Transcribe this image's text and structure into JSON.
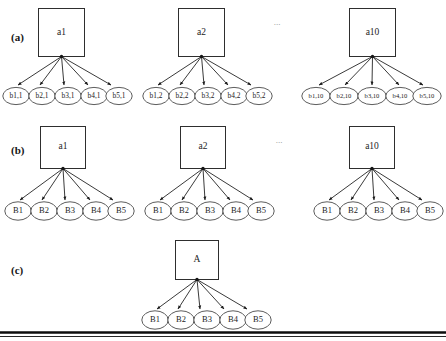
{
  "figure": {
    "caption_rows": [
      {
        "id": "row-a",
        "label": "(a)"
      },
      {
        "id": "row-b",
        "label": "(b)"
      },
      {
        "id": "row-c",
        "label": "(c)"
      }
    ],
    "ellipsis": "...",
    "rows": [
      {
        "id": "row-a",
        "label": "(a)",
        "groups": [
          {
            "id": "group-a1",
            "root": "a1",
            "leaves": [
              "b1,1",
              "b2,1",
              "b3,1",
              "b4,1",
              "b5,1"
            ]
          },
          {
            "id": "group-a2",
            "root": "a2",
            "leaves": [
              "b1,2",
              "b2,2",
              "b3,2",
              "b4,2",
              "b5,2"
            ]
          },
          {
            "id": "group-a10",
            "root": "a10",
            "leaves": [
              "b1,10",
              "b2,10",
              "b3,10",
              "b4,10",
              "b5,10"
            ]
          }
        ]
      },
      {
        "id": "row-b",
        "label": "(b)",
        "groups": [
          {
            "id": "group-b1",
            "root": "a1",
            "leaves": [
              "B1",
              "B2",
              "B3",
              "B4",
              "B5"
            ]
          },
          {
            "id": "group-b2",
            "root": "a2",
            "leaves": [
              "B1",
              "B2",
              "B3",
              "B4",
              "B5"
            ]
          },
          {
            "id": "group-b10",
            "root": "a10",
            "leaves": [
              "B1",
              "B2",
              "B3",
              "B4",
              "B5"
            ]
          }
        ]
      },
      {
        "id": "row-c",
        "label": "(c)",
        "groups": [
          {
            "id": "group-c1",
            "root": "A",
            "leaves": [
              "B1",
              "B2",
              "B3",
              "B4",
              "B5"
            ]
          }
        ]
      }
    ]
  },
  "colors": {
    "ink": "#1a1a1a",
    "box_stroke": "#2e2e2e",
    "ellipse_stroke": "#4a4a4a",
    "edge": "#242424",
    "rule": "#0d0d0d",
    "background": "#ffffff"
  }
}
